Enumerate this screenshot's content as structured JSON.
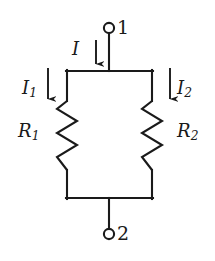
{
  "figure": {
    "name": "parallel-resistor-circuit",
    "background_color": "#ffffff",
    "line_color": "#1a1a1a"
  },
  "labels": {
    "current_total": "I",
    "current_branch1_main": "I",
    "current_branch1_sub": "1",
    "current_branch2_main": "I",
    "current_branch2_sub": "2",
    "resistor1_main": "R",
    "resistor1_sub": "1",
    "resistor2_main": "R",
    "resistor2_sub": "2",
    "terminal_top": "1",
    "terminal_bottom": "2"
  },
  "components": {
    "resistor1": {
      "name": "R1",
      "orientation": "vertical",
      "zigzag_peaks": 6
    },
    "resistor2": {
      "name": "R2",
      "orientation": "vertical",
      "zigzag_peaks": 6
    },
    "terminal1": {
      "name": "node-1",
      "shape": "open-circle"
    },
    "terminal2": {
      "name": "node-2",
      "shape": "open-circle"
    }
  },
  "arrows": {
    "total_current": {
      "direction": "down",
      "label": "I"
    },
    "branch1_current": {
      "direction": "down",
      "label": "I1"
    },
    "branch2_current": {
      "direction": "down",
      "label": "I2"
    }
  }
}
